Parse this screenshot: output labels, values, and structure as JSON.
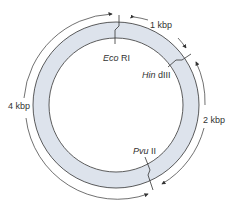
{
  "diagram": {
    "type": "plasmid restriction map",
    "ring_fill": "#dde3ec",
    "stroke": "#333333",
    "sites": [
      {
        "enzyme_italic": "Eco",
        "enzyme_suffix": "RI",
        "label": "Eco RI"
      },
      {
        "enzyme_italic": "Hin",
        "enzyme_suffix": "dIII",
        "label": "Hin dIII"
      },
      {
        "enzyme_italic": "Pvu",
        "enzyme_suffix": "II",
        "label": "Pvu II"
      }
    ],
    "segments": [
      {
        "label": "1 kbp",
        "from": "Eco RI",
        "to": "Hin dIII"
      },
      {
        "label": "2 kbp",
        "from": "Hin dIII",
        "to": "Pvu II"
      },
      {
        "label": "4 kbp",
        "from": "Pvu II",
        "to": "Eco RI"
      }
    ]
  }
}
